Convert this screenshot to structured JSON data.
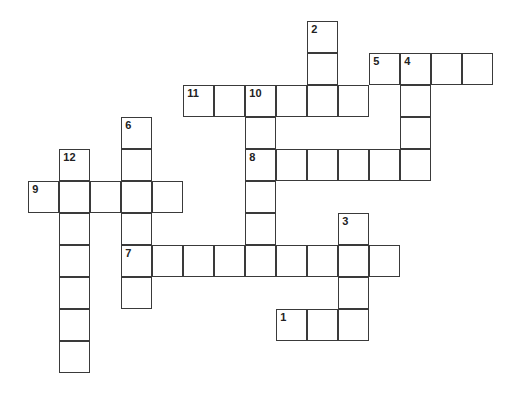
{
  "puzzle": {
    "type": "crossword",
    "grid_origin": {
      "x": 29,
      "y": 22
    },
    "cell_w": 31,
    "cell_h": 32,
    "colors": {
      "border": "#3a3a3a",
      "background": "#ffffff",
      "number": "#222222"
    },
    "entries": [
      {
        "number": "1",
        "direction": "across",
        "row": 9,
        "col": 8,
        "length": 3
      },
      {
        "number": "2",
        "direction": "down",
        "row": 0,
        "col": 9,
        "length": 3
      },
      {
        "number": "3",
        "direction": "down",
        "row": 6,
        "col": 10,
        "length": 4
      },
      {
        "number": "4",
        "direction": "down",
        "row": 1,
        "col": 12,
        "length": 4
      },
      {
        "number": "5",
        "direction": "across",
        "row": 1,
        "col": 11,
        "length": 4
      },
      {
        "number": "6",
        "direction": "down",
        "row": 3,
        "col": 3,
        "length": 6
      },
      {
        "number": "7",
        "direction": "across",
        "row": 7,
        "col": 3,
        "length": 9
      },
      {
        "number": "8",
        "direction": "across",
        "row": 4,
        "col": 7,
        "length": 6
      },
      {
        "number": "9",
        "direction": "across",
        "row": 5,
        "col": 0,
        "length": 5
      },
      {
        "number": "10",
        "direction": "down",
        "row": 2,
        "col": 7,
        "length": 6
      },
      {
        "number": "11",
        "direction": "across",
        "row": 2,
        "col": 5,
        "length": 6
      },
      {
        "number": "12",
        "direction": "down",
        "row": 4,
        "col": 1,
        "length": 7
      }
    ]
  }
}
